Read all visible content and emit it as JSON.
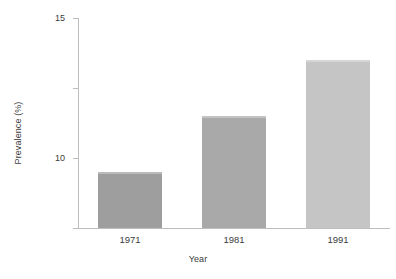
{
  "chart_data": {
    "type": "bar",
    "title": "",
    "subtitle": "",
    "xlabel": "Year",
    "ylabel": "Prevalence (%)",
    "categories": [
      "1971",
      "1981",
      "1991"
    ],
    "values": [
      4,
      8,
      12
    ],
    "series": [
      {
        "name": "Prevalence",
        "values": [
          4,
          8,
          12
        ]
      }
    ],
    "ylim": [
      0,
      15
    ],
    "y_ticks": [
      0,
      5,
      10,
      15
    ],
    "y_tick_labels": [
      "0",
      "5",
      "10",
      "15"
    ],
    "x_ticks": [
      "1971",
      "1981",
      "1991"
    ],
    "grid": false,
    "legend": false,
    "legend_position": "none",
    "annotations": [],
    "bar_colors": [
      "#9e9e9e",
      "#a9a9a9",
      "#c5c5c5"
    ],
    "axis_color": "#bdbdbd",
    "text_color": "#3b3b3b",
    "background_color": "#ffffff"
  }
}
